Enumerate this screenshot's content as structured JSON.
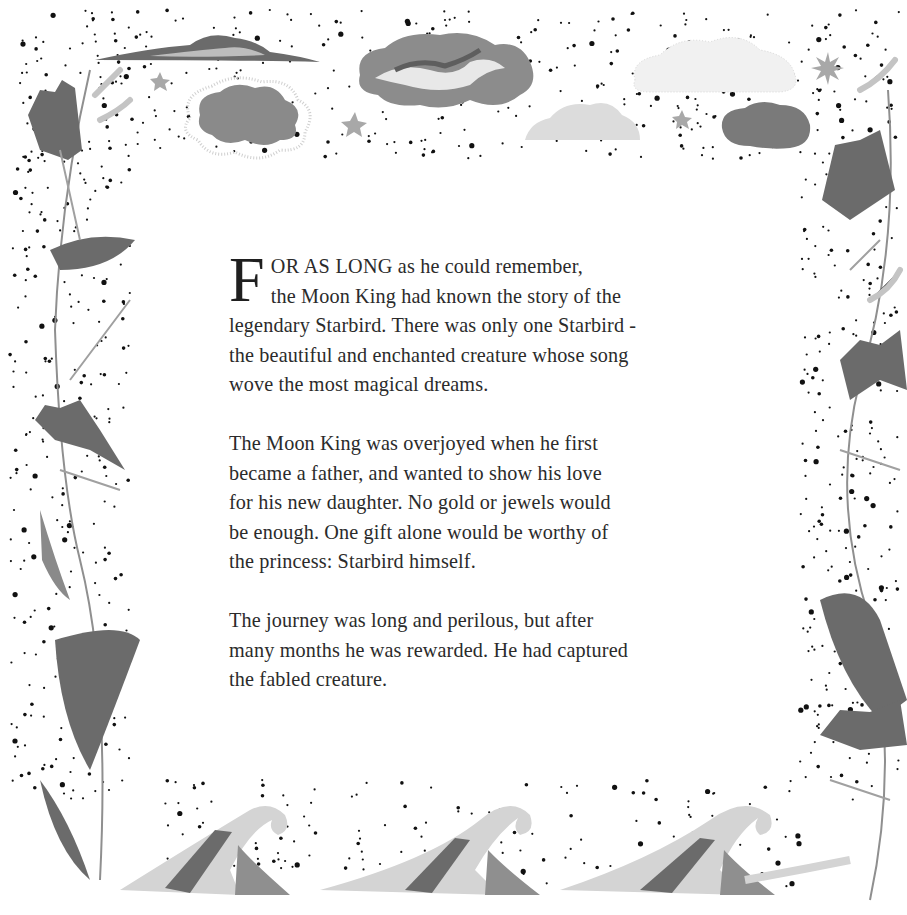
{
  "page": {
    "type": "storybook-page",
    "illustration": {
      "border_top": "clouds-and-stars",
      "border_left": "leaves-and-ferns",
      "border_right": "leaves-and-ferns",
      "border_bottom": "curling-waves",
      "palette": {
        "dark": "#6b6b6b",
        "mid": "#9a9a9a",
        "light": "#d2d2d2",
        "dots": "#111111",
        "text": "#2b2b2b"
      }
    }
  },
  "story": {
    "paragraphs": [
      {
        "dropcap": "F",
        "lead_caps": "OR AS LONG",
        "lines": [
          " as he could remember,",
          "the Moon King had known the story of the",
          "legendary Starbird. There was only one Starbird -",
          "the beautiful and enchanted creature whose song",
          "wove the most magical dreams."
        ]
      },
      {
        "lines": [
          "The Moon King was overjoyed when he first",
          "became a father, and wanted to show his love",
          "for his new daughter. No gold or jewels would",
          "be enough. One gift alone would be worthy of",
          "the princess: Starbird himself."
        ]
      },
      {
        "lines": [
          "The journey was long and perilous, but after",
          "many months he was rewarded. He had captured",
          "the fabled creature."
        ]
      }
    ]
  }
}
